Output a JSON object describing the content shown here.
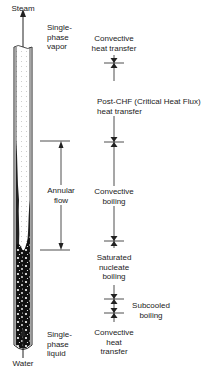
{
  "diagram": {
    "inlet_label": "Water",
    "outlet_label": "Steam",
    "phase_labels": {
      "top": [
        "Single-",
        "phase",
        "vapor"
      ],
      "bottom": [
        "Single-",
        "phase",
        "liquid"
      ]
    },
    "flow_region": {
      "label": [
        "Annular",
        "flow"
      ]
    },
    "regimes": [
      {
        "id": "convective-heat-transfer-vapor",
        "label": [
          "Convective",
          "heat transfer"
        ]
      },
      {
        "id": "post-chf",
        "label": [
          "Post-CHF (Critical Heat Flux)",
          "heat transfer"
        ]
      },
      {
        "id": "convective-boiling",
        "label": [
          "Convective",
          "boiling"
        ]
      },
      {
        "id": "saturated-nucleate-boiling",
        "label": [
          "Saturated",
          "nucleate",
          "boiling"
        ]
      },
      {
        "id": "subcooled-boiling",
        "label": [
          "Subcooled",
          "boiling"
        ]
      },
      {
        "id": "convective-heat-transfer-liquid",
        "label": [
          "Convective",
          "heat",
          "transfer"
        ]
      }
    ],
    "colors": {
      "line": "#222222",
      "liquid": "#111111",
      "vapor_dots": "#999999"
    }
  }
}
